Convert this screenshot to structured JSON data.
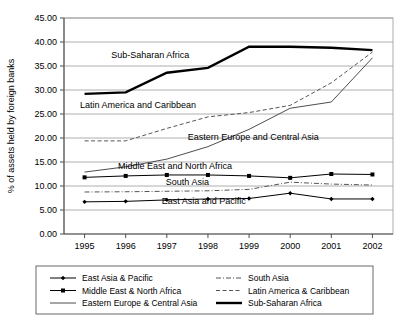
{
  "chart_data": {
    "type": "line",
    "title": "",
    "xlabel": "",
    "ylabel": "% of assets held by foreign banks",
    "x": [
      "1995",
      "1996",
      "1997",
      "1998",
      "1999",
      "2000",
      "2001",
      "2002"
    ],
    "categories": [
      "1995",
      "1996",
      "1997",
      "1998",
      "1999",
      "2000",
      "2001",
      "2002"
    ],
    "ylim": [
      0,
      45
    ],
    "ytick_labels": [
      "0.00",
      "5.00",
      "10.00",
      "15.00",
      "20.00",
      "25.00",
      "30.00",
      "35.00",
      "40.00",
      "45.00"
    ],
    "ytick_values": [
      0,
      5,
      10,
      15,
      20,
      25,
      30,
      35,
      40,
      45
    ],
    "grid": true,
    "legend_position": "bottom",
    "series": [
      {
        "name": "East Asia & Pacific",
        "legend_label": "East Asia & Pacific",
        "style": "solid-thin-marker-diamond",
        "color": "#000000",
        "values": [
          6.7,
          6.8,
          7.1,
          7.3,
          7.4,
          8.5,
          7.3,
          7.3
        ]
      },
      {
        "name": "Middle East & North Africa",
        "legend_label": "Middle East & North Africa",
        "style": "solid-thin-marker-square",
        "color": "#000000",
        "values": [
          11.8,
          12.1,
          12.3,
          12.3,
          12.1,
          11.7,
          12.5,
          12.4
        ]
      },
      {
        "name": "Eastern Europe & Central Asia",
        "legend_label": "Eastern Europe & Central Asia",
        "style": "solid-thin",
        "color": "#4d4d4d",
        "values": [
          12.9,
          14.0,
          15.6,
          18.2,
          21.8,
          26.2,
          27.5,
          36.7
        ]
      },
      {
        "name": "South Asia",
        "legend_label": "South Asia",
        "style": "dash-dot",
        "color": "#555555",
        "values": [
          8.75,
          8.8,
          8.9,
          9.0,
          9.3,
          10.8,
          10.4,
          10.2
        ]
      },
      {
        "name": "Latin America & Caribbean",
        "legend_label": "Latin America & Caribbean",
        "style": "dashed",
        "color": "#555555",
        "values": [
          19.4,
          19.4,
          22.0,
          24.4,
          25.3,
          26.8,
          31.5,
          37.9
        ]
      },
      {
        "name": "Sub-Saharan Africa",
        "legend_label": "Sub-Saharan Africa",
        "style": "solid-thick",
        "color": "#000000",
        "values": [
          29.2,
          29.5,
          33.6,
          34.6,
          39.0,
          39.0,
          38.8,
          38.3
        ]
      }
    ],
    "annotations": [
      {
        "text": "Sub-Saharan Africa",
        "x": 1996.6,
        "y": 36.6
      },
      {
        "text": "Latin America and Caribbean",
        "x": 1996.3,
        "y": 26.3
      },
      {
        "text": "Eastern Europe and Central Asia",
        "x": 1999.1,
        "y": 19.6
      },
      {
        "text": "Middle East and North Africa",
        "x": 1997.2,
        "y": 13.6
      },
      {
        "text": "South Asia",
        "x": 1997.5,
        "y": 10.3
      },
      {
        "text": "East Asia and Pacific",
        "x": 1997.9,
        "y": 6.3
      }
    ]
  },
  "legend": {
    "items": [
      {
        "label": "East Asia & Pacific",
        "style": "solid-thin-marker-diamond"
      },
      {
        "label": "South Asia",
        "style": "dash-dot"
      },
      {
        "label": "Middle East & North Africa",
        "style": "solid-thin-marker-square"
      },
      {
        "label": "Latin America & Caribbean",
        "style": "dashed"
      },
      {
        "label": "Eastern Europe & Central Asia",
        "style": "solid-thin"
      },
      {
        "label": "Sub-Saharan Africa",
        "style": "solid-thick"
      }
    ]
  }
}
